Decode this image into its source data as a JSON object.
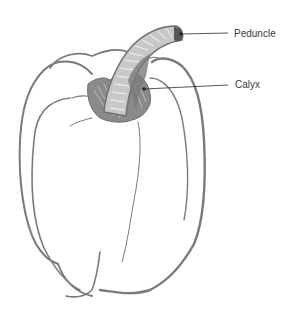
{
  "diagram": {
    "colors": {
      "outline": "#7a7a7a",
      "stem_dark": "#6e6e6e",
      "leader_line": "#2a2a2a",
      "label_text": "#3a3a3a",
      "background": "#ffffff"
    },
    "labels": [
      {
        "id": "peduncle",
        "text": "Peduncle",
        "points_to": "stem tip"
      },
      {
        "id": "calyx",
        "text": "Calyx",
        "points_to": "base of stem"
      }
    ]
  }
}
